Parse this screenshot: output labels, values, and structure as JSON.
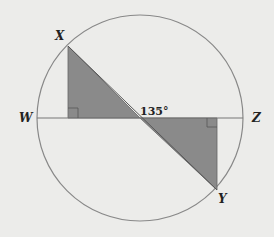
{
  "diagram": {
    "points": {
      "X": "X",
      "Y": "Y",
      "W": "W",
      "Z": "Z"
    },
    "angle_label": "135°",
    "colors": {
      "shade": "#8a8a8a",
      "stroke": "#777777",
      "background": "#ececea"
    }
  }
}
